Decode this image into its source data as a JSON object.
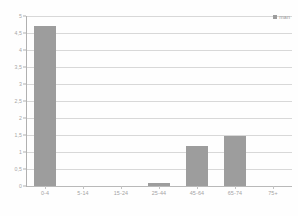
{
  "chart_data": {
    "type": "bar",
    "title": "",
    "subtitle": "",
    "xlabel": "",
    "ylabel": "",
    "categories": [
      "0-4",
      "5-14",
      "15-24",
      "25-44",
      "45-64",
      "65-74",
      "75+"
    ],
    "series": [
      {
        "name": "man",
        "values": [
          4.72,
          0,
          0,
          0.08,
          1.18,
          1.48,
          0
        ]
      }
    ],
    "values": [
      4.72,
      0,
      0,
      0.08,
      1.18,
      0,
      1.48
    ],
    "ylim": [
      0,
      5
    ],
    "ytick_labels": [
      "0",
      "0,5",
      "1",
      "1,5",
      "2",
      "2,5",
      "3",
      "3,5",
      "4",
      "4,5",
      "5"
    ],
    "ytick_values": [
      0,
      0.5,
      1,
      1.5,
      2,
      2.5,
      3,
      3.5,
      4,
      4.5,
      5
    ],
    "grid": true,
    "legend": {
      "position": "top-right",
      "entries": [
        {
          "label": "man",
          "color": "#9d9d9d",
          "marker": "square"
        }
      ]
    },
    "colors": {
      "bar": "#9d9d9d",
      "gridline": "#d8d8d8",
      "axis": "#b0b0b0",
      "tick_text": "#a3a3a3",
      "background": "#fefefe"
    }
  }
}
